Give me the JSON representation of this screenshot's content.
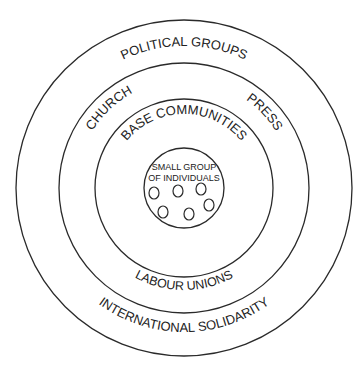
{
  "diagram": {
    "type": "concentric-circles",
    "center": [
      184,
      188
    ],
    "rings": [
      {
        "name": "outer",
        "r": 168
      },
      {
        "name": "second",
        "r": 125
      },
      {
        "name": "third",
        "r": 89
      },
      {
        "name": "inner",
        "r": 40
      }
    ],
    "labels": {
      "political_groups": "POLITICAL GROUPS",
      "church": "CHURCH",
      "press": "PRESS",
      "base_communities": "BASE COMMUNITIES",
      "small_group_line1": "SMALL GROUP",
      "small_group_line2": "OF INDIVIDUALS",
      "labour_unions": "LABOUR UNIONS",
      "international_solidarity": "INTERNATIONAL SOLIDARITY"
    },
    "individuals_count": 6
  }
}
